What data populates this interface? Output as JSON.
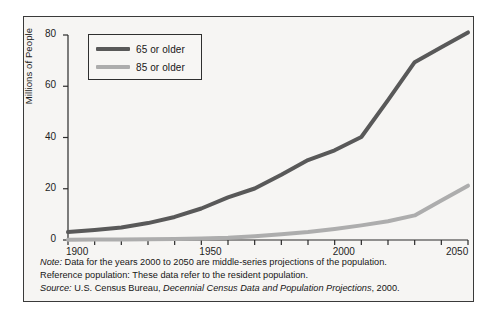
{
  "chart_data": {
    "type": "line",
    "title": "",
    "xlabel": "",
    "ylabel": "Millions of People",
    "xlim": [
      1900,
      2050
    ],
    "ylim": [
      0,
      80
    ],
    "yticks": [
      0,
      20,
      40,
      60,
      80
    ],
    "xticks": [
      1900,
      1950,
      2000,
      2050
    ],
    "xtick_labels": [
      "1900",
      "1950",
      "2000",
      "2050"
    ],
    "ytick_labels": [
      "0",
      "20",
      "40",
      "60",
      "80"
    ],
    "minor_xtick_interval": 10,
    "grid": false,
    "legend_position": "upper left",
    "series": [
      {
        "name": "65 or older",
        "color": "#595959",
        "x": [
          1900,
          1910,
          1920,
          1930,
          1940,
          1950,
          1960,
          1970,
          1980,
          1990,
          2000,
          2010,
          2020,
          2030,
          2040,
          2050
        ],
        "values": [
          3.1,
          3.9,
          4.9,
          6.6,
          9.0,
          12.3,
          16.6,
          20.1,
          25.5,
          31.2,
          35.0,
          40.2,
          54.6,
          69.4,
          75.2,
          81.0
        ]
      },
      {
        "name": "85 or older",
        "color": "#adadad",
        "x": [
          1900,
          1910,
          1920,
          1930,
          1940,
          1950,
          1960,
          1970,
          1980,
          1990,
          2000,
          2010,
          2020,
          2030,
          2040,
          2050
        ],
        "values": [
          0.1,
          0.2,
          0.2,
          0.3,
          0.4,
          0.6,
          0.9,
          1.5,
          2.2,
          3.1,
          4.3,
          5.7,
          7.3,
          9.6,
          15.4,
          21.2
        ]
      }
    ]
  },
  "legend": {
    "items": [
      {
        "label": "65 or older",
        "color": "#595959"
      },
      {
        "label": "85 or older",
        "color": "#adadad"
      }
    ]
  },
  "notes": {
    "note_key": "Note:",
    "note_text": "Data for the years 2000 to 2050 are middle-series projections of the population.",
    "reference_key": "Reference population:",
    "reference_text": "These data refer to the resident population.",
    "source_key": "Source:",
    "source_publisher": "U.S. Census Bureau,",
    "source_title": "Decennial Census Data and Population Projections",
    "source_year": ", 2000."
  }
}
